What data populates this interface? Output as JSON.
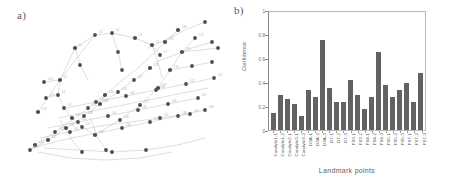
{
  "figure": {
    "panel_a": {
      "label": "a)"
    },
    "panel_b": {
      "label": "b)"
    }
  },
  "chart_data": {
    "type": "bar",
    "title": "",
    "xlabel": "Landmark points",
    "ylabel": "Confidence",
    "ylim": [
      0,
      1
    ],
    "yticks": [
      "0",
      "0.2",
      "0.4",
      "0.6",
      "0.8",
      "1"
    ],
    "grid": false,
    "legend": "none",
    "bar_color": "#626262",
    "categories": [
      "Condyle1-1",
      "Condyle1-2",
      "Condyle2-1",
      "Condyle3-1",
      "Condyle3-2",
      "D3A-1",
      "D3A-2",
      "D3A-3",
      "D7-1",
      "D7-2",
      "D7-3",
      "F03-1",
      "F03-2",
      "F04-1",
      "F04-2",
      "F04-3",
      "F05-1",
      "F05-2",
      "F05-3",
      "F07-1",
      "F07-2",
      "F07-3"
    ],
    "values": [
      0.14,
      0.3,
      0.26,
      0.22,
      0.12,
      0.34,
      0.28,
      0.76,
      0.36,
      0.24,
      0.24,
      0.42,
      0.3,
      0.18,
      0.28,
      0.66,
      0.38,
      0.28,
      0.34,
      0.4,
      0.24,
      0.48
    ]
  },
  "graph_a": {
    "node_color": "#4a4a4a",
    "edge_color": "#b5b5b5",
    "label_color": "#9a9a9a",
    "description": "landmark point graph"
  }
}
